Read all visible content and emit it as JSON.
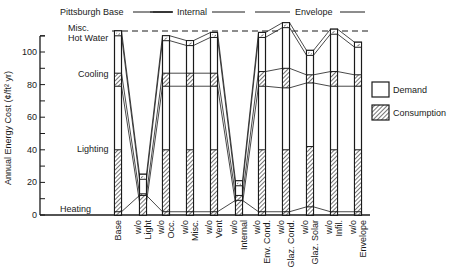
{
  "chart_data": {
    "type": "bar",
    "title": "",
    "xlabel": "",
    "ylabel": "Annual Energy Cost (¢/ft² yr)",
    "ylim": [
      0,
      110
    ],
    "yticks": [
      0,
      20,
      40,
      60,
      80,
      100
    ],
    "grid": false,
    "legend_position": "right",
    "legend": [
      "Demand",
      "Consumption"
    ],
    "group_labels": [
      {
        "label": "Pittsburgh Base",
        "span": [
          "Base"
        ]
      },
      {
        "label": "Internal",
        "span": [
          "w/o Light",
          "w/o Occ.",
          "w/o Misc.",
          "w/o Vent"
        ]
      },
      {
        "label": "Envelope",
        "span": [
          "w/o Env. Cond.",
          "w/o Glaz. Cond.",
          "w/o Glaz. Solar",
          "w/o Infil.",
          "w/o Envelope"
        ]
      }
    ],
    "component_labels": [
      "Heating",
      "Lighting",
      "Cooling",
      "Hot Water",
      "Misc."
    ],
    "reference_line": {
      "label": "Pittsburgh Base total",
      "value": 113,
      "style": "dashed"
    },
    "categories": [
      "Base",
      "w/o Light",
      "w/o Occ.",
      "w/o Misc.",
      "w/o Vent",
      "w/o Internal",
      "w/o Env. Cond.",
      "w/o Glaz. Cond.",
      "w/o Glaz. Solar",
      "w/o Infil.",
      "w/o Envelope"
    ],
    "series": [
      {
        "name": "Heating (Consumption)",
        "values": [
          2,
          12,
          2,
          2,
          2,
          9,
          2,
          2,
          5,
          2,
          2
        ]
      },
      {
        "name": "Lighting (Consumption)",
        "values": [
          38,
          0,
          38,
          38,
          38,
          0,
          38,
          38,
          37,
          38,
          38
        ]
      },
      {
        "name": "Lighting/Base (Demand)",
        "values": [
          39,
          0,
          39,
          39,
          39,
          0,
          39,
          39,
          38,
          39,
          39
        ]
      },
      {
        "name": "Cooling (Consumption)",
        "values": [
          8,
          5,
          8,
          8,
          8,
          5,
          9,
          10,
          5,
          9,
          7
        ]
      },
      {
        "name": "Cooling (Demand)",
        "values": [
          18,
          4,
          17,
          18,
          18,
          4,
          18,
          20,
          10,
          18,
          15
        ]
      },
      {
        "name": "Hot Water",
        "values": [
          3,
          2,
          3,
          0,
          3,
          2,
          3,
          3,
          3,
          3,
          3
        ]
      },
      {
        "name": "Misc.",
        "values": [
          5,
          2,
          3,
          2,
          4,
          1,
          3,
          6,
          3,
          5,
          2
        ]
      }
    ],
    "totals": [
      113,
      25,
      110,
      107,
      112,
      21,
      112,
      118,
      101,
      114,
      106
    ],
    "lighting_top": [
      40,
      0,
      40,
      40,
      40,
      0,
      40,
      40,
      42,
      40,
      40
    ],
    "cooling_band": [
      [
        79,
        87
      ],
      [
        8,
        13
      ],
      [
        79,
        87
      ],
      [
        79,
        87
      ],
      [
        79,
        87
      ],
      [
        7,
        12
      ],
      [
        79,
        88
      ],
      [
        78,
        90
      ],
      [
        81,
        86
      ],
      [
        79,
        88
      ],
      [
        79,
        86
      ]
    ]
  },
  "labels": {
    "group_base": "Pittsburgh Base",
    "group_internal": "Internal",
    "group_envelope": "Envelope",
    "comp_misc": "Misc.",
    "comp_hotwater": "Hot Water",
    "comp_cooling": "Cooling",
    "comp_lighting": "Lighting",
    "comp_heating": "Heating",
    "legend_demand": "Demand",
    "legend_consumption": "Consumption",
    "ylabel": "Annual Energy Cost (¢/ft² yr)"
  },
  "xlabels": [
    {
      "line1": "",
      "line2": "Base"
    },
    {
      "line1": "w/o",
      "line2": "Light"
    },
    {
      "line1": "w/o",
      "line2": "Occ."
    },
    {
      "line1": "w/o",
      "line2": "Misc."
    },
    {
      "line1": "w/o",
      "line2": "Vent"
    },
    {
      "line1": "w/o",
      "line2": "Internal"
    },
    {
      "line1": "w/o",
      "line2": "Env. Cond."
    },
    {
      "line1": "w/o",
      "line2": "Glaz. Cond."
    },
    {
      "line1": "w/o",
      "line2": "Glaz. Solar"
    },
    {
      "line1": "w/o",
      "line2": "Infil."
    },
    {
      "line1": "w/o",
      "line2": "Envelope"
    }
  ],
  "colors": {
    "ink": "#1a1a1a",
    "background": "#ffffff"
  }
}
